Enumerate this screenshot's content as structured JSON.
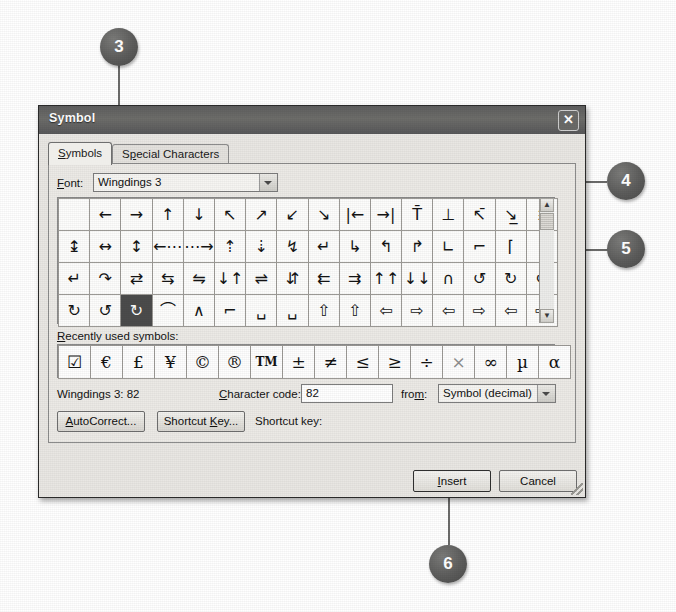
{
  "window": {
    "title": "Symbol",
    "close_icon": "close-icon"
  },
  "tabs": [
    {
      "label": "Symbols",
      "selected": true
    },
    {
      "label": "Special Characters",
      "selected": false
    }
  ],
  "font_row": {
    "label": "Font:",
    "value": "Wingdings 3",
    "dropdown_icon": "chevron-down-icon"
  },
  "symbol_grid": {
    "columns": 16,
    "rows": 4,
    "selected_row": 3,
    "selected_col": 2,
    "cells": [
      [
        "",
        "←",
        "→",
        "↑",
        "↓",
        "↖",
        "↗",
        "↙",
        "↘",
        "|←",
        "→|",
        "T̄",
        "⊥",
        "↖̄",
        "↘̲",
        "↨"
      ],
      [
        "↨",
        "↔",
        "↕",
        "←⋯",
        "⋯→",
        "⇡",
        "⇣",
        "↯",
        "↵",
        "↳",
        "↰",
        "↱",
        "∟",
        "⌐",
        "⌈",
        "⌉"
      ],
      [
        "↵",
        "↷",
        "⇄",
        "⇆",
        "⇋",
        "↓↑",
        "⇌",
        "⇵",
        "⇇",
        "⇉",
        "↑↑",
        "↓↓",
        "∩",
        "↺",
        "↻",
        "↺"
      ],
      [
        "↻",
        "↺",
        "↻",
        "⌒",
        "∧",
        "⌐",
        "␣",
        "␣",
        "⇧",
        "⇧",
        "⇦",
        "⇨",
        "⇦",
        "⇨",
        "⇦",
        "⇨"
      ]
    ],
    "scrollbar": {
      "up_icon": "scroll-up-icon",
      "down_icon": "scroll-down-icon",
      "thumb": "scroll-thumb"
    }
  },
  "recently_used": {
    "label": "Recently used symbols:",
    "symbols": [
      "☑",
      "€",
      "£",
      "¥",
      "©",
      "®",
      "TM",
      "±",
      "≠",
      "≤",
      "≥",
      "÷",
      "×",
      "∞",
      "µ",
      "α"
    ]
  },
  "info_row": {
    "font_info": "Wingdings 3: 82",
    "character_code_label": "Character code:",
    "character_code_value": "82",
    "from_label": "from:",
    "from_value": "Symbol (decimal)",
    "from_dropdown_icon": "chevron-down-icon"
  },
  "panel_buttons": {
    "autocorrect": "AutoCorrect...",
    "shortcut_key": "Shortcut Key...",
    "shortcut_key_label": "Shortcut key:"
  },
  "footer_buttons": {
    "insert": "Insert",
    "cancel": "Cancel"
  },
  "callouts": [
    {
      "number": "3"
    },
    {
      "number": "4"
    },
    {
      "number": "5"
    },
    {
      "number": "6"
    }
  ]
}
